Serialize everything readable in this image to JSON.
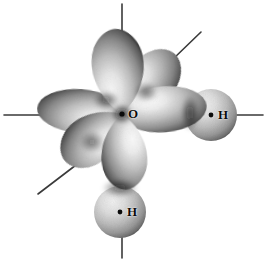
{
  "figure": {
    "width": 267,
    "height": 260,
    "background_color": "#ffffff",
    "style": "grayscale airbrush shaded orbital illustration"
  },
  "colors": {
    "background": "#ffffff",
    "ink": "#0b0b0b",
    "axis_line": "#3a3a3a",
    "lobe_highlight": "#f2f2f2",
    "lobe_midtone": "#9a9a9a",
    "lobe_shadow": "#2b2b2b",
    "sphere_highlight": "#ededed",
    "sphere_shadow": "#4a4a4a"
  },
  "atoms": [
    {
      "id": "oxygen",
      "element": "O",
      "label": "O",
      "label_x": 133,
      "label_y": 114,
      "nucleus_x": 122,
      "nucleus_y": 114,
      "show_dot": false,
      "kind": "central-atom"
    },
    {
      "id": "hydrogen-right",
      "element": "H",
      "label": "H",
      "label_x": 222,
      "label_y": 115,
      "nucleus_x": 211,
      "nucleus_y": 115,
      "show_dot": true,
      "kind": "bonded-atom"
    },
    {
      "id": "hydrogen-bottom",
      "element": "H",
      "label": "H",
      "label_x": 131,
      "label_y": 212,
      "nucleus_x": 120,
      "nucleus_y": 212,
      "show_dot": true,
      "kind": "bonded-atom"
    }
  ],
  "orbital_lobes": [
    {
      "id": "lobe-top",
      "name": "lone-pair-lobe-up",
      "shape": "teardrop",
      "angle_deg": -96,
      "length": 86,
      "width": 52,
      "description": "large teardrop lobe pointing straight up"
    },
    {
      "id": "lobe-upper-right",
      "name": "lone-pair-lobe-upper-right",
      "shape": "ellipse",
      "angle_deg": -47,
      "length": 66,
      "width": 46,
      "description": "rounded lobe angled up and to the right"
    },
    {
      "id": "lobe-left",
      "name": "lone-pair-lobe-left",
      "shape": "ellipse",
      "angle_deg": 182,
      "length": 84,
      "width": 44,
      "description": "elongated lobe pointing left"
    },
    {
      "id": "lobe-lower-left",
      "name": "lone-pair-lobe-lower-left",
      "shape": "teardrop",
      "angle_deg": 139,
      "length": 74,
      "width": 48,
      "description": "teardrop lobe angled down and to the left"
    },
    {
      "id": "lobe-right-bond",
      "name": "bonding-lobe-right",
      "shape": "ellipse",
      "angle_deg": -4,
      "length": 82,
      "width": 44,
      "description": "bonding lobe pointing right toward hydrogen"
    },
    {
      "id": "lobe-bottom-bond",
      "name": "bonding-lobe-down",
      "shape": "teardrop",
      "angle_deg": 86,
      "length": 76,
      "width": 46,
      "description": "bonding lobe pointing down toward hydrogen"
    }
  ],
  "spheres": [
    {
      "id": "sphere-h-right",
      "name": "hydrogen-sphere-right",
      "cx": 211,
      "cy": 115,
      "r": 26
    },
    {
      "id": "sphere-h-bottom",
      "name": "hydrogen-sphere-bottom",
      "cx": 120,
      "cy": 212,
      "r": 26
    }
  ],
  "axis_lines": [
    {
      "id": "axis-top",
      "name": "axis-line-up",
      "x1": 122,
      "y1": 4,
      "x2": 122,
      "y2": 33
    },
    {
      "id": "axis-upper-right",
      "name": "axis-line-upper-right",
      "x1": 201,
      "y1": 32,
      "x2": 178,
      "y2": 54
    },
    {
      "id": "axis-left",
      "name": "axis-line-left",
      "x1": 4,
      "y1": 115,
      "x2": 42,
      "y2": 115
    },
    {
      "id": "axis-lower-left",
      "name": "axis-line-lower-left",
      "x1": 38,
      "y1": 194,
      "x2": 70,
      "y2": 170
    },
    {
      "id": "axis-right",
      "name": "axis-line-right",
      "x1": 234,
      "y1": 115,
      "x2": 263,
      "y2": 115
    },
    {
      "id": "axis-bottom",
      "name": "axis-line-down",
      "x1": 122,
      "y1": 231,
      "x2": 122,
      "y2": 258
    }
  ]
}
